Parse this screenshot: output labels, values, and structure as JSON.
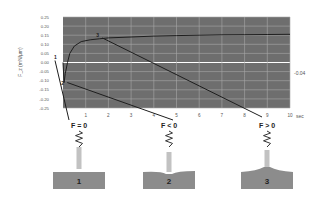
{
  "chart_data": {
    "type": "line",
    "title": "",
    "xlabel": "sec",
    "ylabel": "F_z (mN/µm)",
    "xlim": [
      0,
      10
    ],
    "ylim": [
      -0.25,
      0.25
    ],
    "x_ticks": [
      "1",
      "2",
      "3",
      "4",
      "5",
      "6",
      "7",
      "8",
      "9",
      "10"
    ],
    "y_ticks": [
      "0.25",
      "0.20",
      "0.15",
      "0.10",
      "0.05",
      "0.00",
      "-0.05",
      "-0.10",
      "-0.15",
      "-0.20",
      "-0.25"
    ],
    "grid": true,
    "right_annotation": "-0.04",
    "series": [
      {
        "name": "Force",
        "x": [
          0.0,
          0.05,
          0.1,
          0.2,
          0.3,
          0.5,
          0.8,
          1.2,
          1.6,
          2.0,
          3.0,
          4.0,
          5.0,
          6.0,
          7.0,
          8.0,
          9.0,
          10.0
        ],
        "y": [
          0.0,
          -0.11,
          -0.06,
          0.0,
          0.05,
          0.09,
          0.115,
          0.125,
          0.13,
          0.135,
          0.14,
          0.145,
          0.148,
          0.15,
          0.152,
          0.153,
          0.154,
          0.155
        ]
      }
    ],
    "annotations": [
      {
        "label": "1",
        "x": 0.0,
        "y": 0.0
      },
      {
        "label": "2",
        "x": 0.1,
        "y": -0.11
      },
      {
        "label": "3",
        "x": 1.6,
        "y": 0.135
      }
    ]
  },
  "panels": [
    {
      "number": "1",
      "condition": "F = 0"
    },
    {
      "number": "2",
      "condition": "F < 0"
    },
    {
      "number": "3",
      "condition": "F > 0"
    }
  ],
  "colors": {
    "plot_bg": "#6e6e6e",
    "grid": "#a8a8a8",
    "zero_line": "#ffffff",
    "curve": "#1e1e1e",
    "substrate": "#8c8c8c",
    "probe": "#c2c2c2"
  }
}
